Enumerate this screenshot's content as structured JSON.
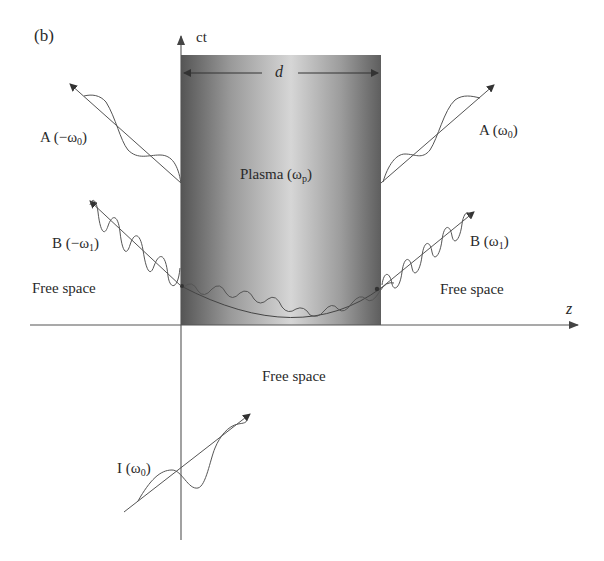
{
  "figure": {
    "panel_label": "(b)",
    "axes": {
      "vertical": "ct",
      "horizontal": "z"
    },
    "slab": {
      "width_label": "d",
      "medium_label": "Plasma (ω",
      "medium_sub": "p",
      "medium_close": ")"
    },
    "regions": {
      "left": "Free space",
      "right": "Free space",
      "bottom": "Free space"
    },
    "waves": {
      "incident": {
        "name": "I (ω",
        "sub": "0",
        "close": ")"
      },
      "A_left": {
        "name": "A (−ω",
        "sub": "0",
        "close": ")"
      },
      "A_right": {
        "name": "A (ω",
        "sub": "0",
        "close": ")"
      },
      "B_left": {
        "name": "B (−ω",
        "sub": "1",
        "close": ")"
      },
      "B_right": {
        "name": "B (ω",
        "sub": "1",
        "close": ")"
      }
    },
    "colors": {
      "line": "#555555",
      "slab_dark": "#5a5a5a",
      "slab_light": "#d4d4d4",
      "text": "#2a2a2a"
    }
  }
}
